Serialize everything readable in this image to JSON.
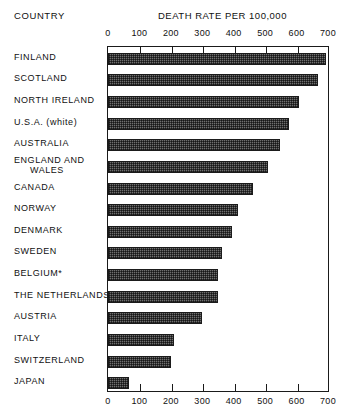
{
  "headers": {
    "country_header": "COUNTRY",
    "chart_title": "DEATH RATE PER 100,000"
  },
  "chart_data": {
    "type": "bar",
    "orientation": "horizontal",
    "title": "DEATH RATE PER 100,000",
    "xlabel": "DEATH RATE PER 100,000",
    "ylabel": "COUNTRY",
    "xlim": [
      0,
      700
    ],
    "xticks": [
      0,
      100,
      200,
      300,
      400,
      500,
      600,
      700
    ],
    "xtick_labels": [
      "0",
      "100",
      "200",
      "300",
      "400",
      "500",
      "600",
      "700"
    ],
    "grid": false,
    "legend": null,
    "axis_top": true,
    "axis_bottom": true,
    "bar_fill": "#6f6f6f",
    "bar_edge": "#1b1b1b",
    "footnote_marker": "*",
    "categories": [
      "FINLAND",
      "SCOTLAND",
      "NORTH IRELAND",
      "U.S.A. (white)",
      "AUSTRALIA",
      "ENGLAND AND WALES",
      "CANADA",
      "NORWAY",
      "DENMARK",
      "SWEDEN",
      "BELGIUM*",
      "THE NETHERLANDS",
      "AUSTRIA",
      "ITALY",
      "SWITZERLAND",
      "JAPAN"
    ],
    "values": [
      693,
      668,
      608,
      576,
      547,
      509,
      462,
      414,
      395,
      364,
      351,
      351,
      300,
      211,
      199,
      66
    ]
  },
  "categories_display": [
    {
      "line1": "FINLAND",
      "line2": ""
    },
    {
      "line1": "SCOTLAND",
      "line2": ""
    },
    {
      "line1": "NORTH IRELAND",
      "line2": ""
    },
    {
      "line1": "U.S.A. (white)",
      "line2": ""
    },
    {
      "line1": "AUSTRALIA",
      "line2": ""
    },
    {
      "line1": "ENGLAND AND",
      "line2": "WALES"
    },
    {
      "line1": "CANADA",
      "line2": ""
    },
    {
      "line1": "NORWAY",
      "line2": ""
    },
    {
      "line1": "DENMARK",
      "line2": ""
    },
    {
      "line1": "SWEDEN",
      "line2": ""
    },
    {
      "line1": "BELGIUM*",
      "line2": ""
    },
    {
      "line1": "THE NETHERLANDS",
      "line2": ""
    },
    {
      "line1": "AUSTRIA",
      "line2": ""
    },
    {
      "line1": "ITALY",
      "line2": ""
    },
    {
      "line1": "SWITZERLAND",
      "line2": ""
    },
    {
      "line1": "JAPAN",
      "line2": ""
    }
  ]
}
